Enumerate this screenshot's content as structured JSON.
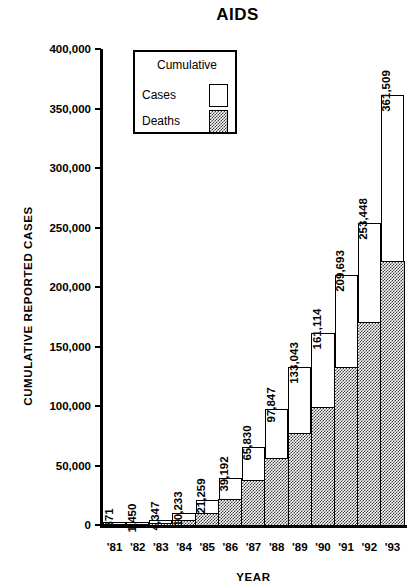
{
  "chart_data": {
    "type": "bar",
    "title": "AIDS",
    "xlabel": "YEAR",
    "ylabel": "CUMULATIVE REPORTED CASES",
    "categories": [
      "'81",
      "'82",
      "'83",
      "'84",
      "'85",
      "'86",
      "'87",
      "'88",
      "'89",
      "'90",
      "'91",
      "'92",
      "'93"
    ],
    "ylim": [
      0,
      400000
    ],
    "ytick_labels": [
      "0",
      "50,000",
      "100,000",
      "150,000",
      "200,000",
      "250,000",
      "300,000",
      "350,000",
      "400,000"
    ],
    "ytick_values": [
      0,
      50000,
      100000,
      150000,
      200000,
      250000,
      300000,
      350000,
      400000
    ],
    "grid": false,
    "legend_position": "upper-left-inside",
    "stacked": true,
    "series": [
      {
        "name": "Cases",
        "values": [
          371,
          1450,
          4347,
          10233,
          21259,
          39192,
          65830,
          97847,
          133043,
          161114,
          209693,
          253448,
          361509
        ],
        "data_labels": [
          "371",
          "1,450",
          "4,347",
          "10,233",
          "21,259",
          "39,192",
          "65,830",
          "97,847",
          "133,043",
          "161,114",
          "209,693",
          "253,448",
          "361,509"
        ]
      },
      {
        "name": "Deaths",
        "values": [
          130,
          600,
          1800,
          5000,
          11000,
          22000,
          38000,
          57000,
          78000,
          100000,
          133000,
          171000,
          222000
        ]
      }
    ]
  },
  "legend": {
    "title": "Cumulative",
    "items": [
      {
        "label": "Cases",
        "swatch": "white-box"
      },
      {
        "label": "Deaths",
        "swatch": "hatched-box"
      }
    ]
  }
}
